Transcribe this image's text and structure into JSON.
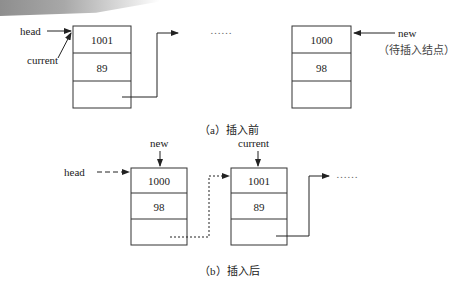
{
  "figure_a": {
    "caption": "（a）插入前",
    "head_label": "head",
    "current_label": "current",
    "new_label": "new",
    "new_note": "（待插入结点）",
    "ellipsis": "……",
    "node_current": {
      "id": "1001",
      "value": "89"
    },
    "node_new": {
      "id": "1000",
      "value": "98"
    }
  },
  "figure_b": {
    "caption": "（b）插入后",
    "head_label": "head",
    "new_label": "new",
    "current_label": "current",
    "ellipsis": "……",
    "node_new": {
      "id": "1000",
      "value": "98"
    },
    "node_current": {
      "id": "1001",
      "value": "89"
    }
  },
  "colors": {
    "line": "#222222",
    "band": "#9a9a9a"
  }
}
